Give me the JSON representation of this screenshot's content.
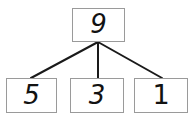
{
  "diagram": {
    "type": "number-bond-tree",
    "root": {
      "value": "9"
    },
    "children": [
      {
        "value": "5"
      },
      {
        "value": "3"
      },
      {
        "value": "1"
      }
    ],
    "colors": {
      "box_border": "#9a9a9a",
      "box_fill": "#ffffff",
      "digit": "#121212",
      "connector": "#1a1a1a",
      "background": "#ffffff"
    },
    "connectors": [
      {
        "name": "root-to-child-0",
        "x1": 98,
        "y1": 42,
        "x2": 31,
        "y2": 78
      },
      {
        "name": "root-to-child-1",
        "x1": 98,
        "y1": 42,
        "x2": 98,
        "y2": 78
      },
      {
        "name": "root-to-child-2",
        "x1": 98,
        "y1": 42,
        "x2": 162,
        "y2": 78
      }
    ]
  }
}
